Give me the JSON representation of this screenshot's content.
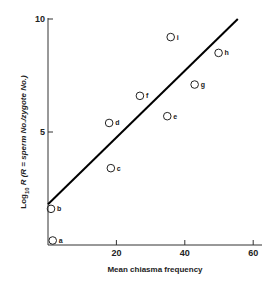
{
  "chart_data": {
    "type": "scatter",
    "title": "",
    "xlabel": "Mean chiasma frequency",
    "ylabel_main": "Log",
    "ylabel_sub": "10",
    "ylabel_rest": "R (R = sperm No./zygote No.)",
    "xlim": [
      0,
      62
    ],
    "ylim": [
      0,
      10
    ],
    "x_ticks": [
      20,
      40,
      60
    ],
    "y_ticks": [
      5,
      10
    ],
    "grid": false,
    "legend": null,
    "points": [
      {
        "label": "a",
        "x": 0.5,
        "y": 0.2
      },
      {
        "label": "b",
        "x": 0,
        "y": 1.6
      },
      {
        "label": "c",
        "x": 17.5,
        "y": 3.4
      },
      {
        "label": "d",
        "x": 17,
        "y": 5.4
      },
      {
        "label": "e",
        "x": 34,
        "y": 5.7
      },
      {
        "label": "f",
        "x": 26,
        "y": 6.6
      },
      {
        "label": "g",
        "x": 42,
        "y": 7.1
      },
      {
        "label": "h",
        "x": 49,
        "y": 8.5
      },
      {
        "label": "i",
        "x": 35,
        "y": 9.2
      }
    ],
    "fit_line": {
      "x0": 0,
      "y0": 1.8,
      "x1": 55.5,
      "y1": 10
    }
  }
}
